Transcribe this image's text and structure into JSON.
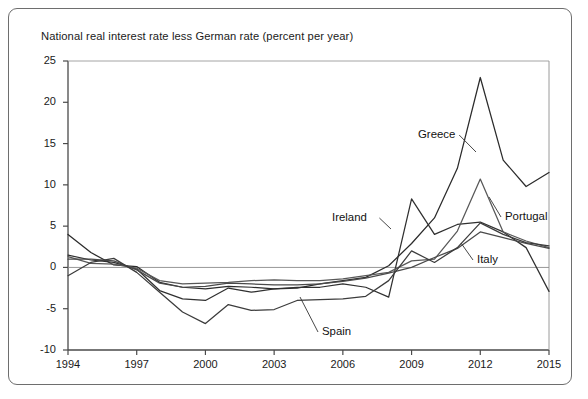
{
  "figure": {
    "title": "National real interest rate less German rate (percent per year)",
    "border_color": "#6e6e6e",
    "background": "#ffffff"
  },
  "axes": {
    "y_ticks": [
      "25",
      "20",
      "15",
      "10",
      "5",
      "0",
      "-5",
      "-10"
    ],
    "x_ticks": [
      "1994",
      "1997",
      "2000",
      "2003",
      "2006",
      "2009",
      "2012",
      "2015"
    ]
  },
  "series_labels": {
    "greece": "Greece",
    "ireland": "Ireland",
    "portugal": "Portugal",
    "italy": "Italy",
    "spain": "Spain"
  },
  "chart_data": {
    "type": "line",
    "title": "National real interest rate less German rate (percent per year)",
    "xlabel": "",
    "ylabel": "National real interest rate less German rate (percent per year)",
    "xlim": [
      1994,
      2015
    ],
    "ylim": [
      -10,
      25
    ],
    "y_ticks": [
      25,
      20,
      15,
      10,
      5,
      0,
      -5,
      -10
    ],
    "x_ticks": [
      1994,
      1997,
      2000,
      2003,
      2006,
      2009,
      2012,
      2015
    ],
    "grid": false,
    "legend": "inline-annotations",
    "zero_line": true,
    "x": [
      1994,
      1995,
      1996,
      1997,
      1998,
      1999,
      2000,
      2001,
      2002,
      2003,
      2004,
      2005,
      2006,
      2007,
      2008,
      2009,
      2010,
      2011,
      2012,
      2013,
      2014,
      2015
    ],
    "series": [
      {
        "name": "Greece",
        "color": "#2b2b2b",
        "values": [
          4.0,
          1.8,
          0.3,
          0.1,
          -1.8,
          -2.4,
          -2.6,
          -2.3,
          -2.4,
          -2.6,
          -2.5,
          -2.0,
          -1.6,
          -1.2,
          0.2,
          2.9,
          6.0,
          12.0,
          23.0,
          13.0,
          9.8,
          11.5
        ]
      },
      {
        "name": "Ireland",
        "color": "#303030",
        "values": [
          1.5,
          0.9,
          0.6,
          -0.2,
          -2.8,
          -3.8,
          -4.0,
          -2.5,
          -3.0,
          -2.6,
          -2.4,
          -2.4,
          -2.0,
          -2.4,
          -3.6,
          8.3,
          4.0,
          5.2,
          5.5,
          4.3,
          2.4,
          -2.9
        ]
      },
      {
        "name": "Portugal",
        "color": "#585858",
        "values": [
          1.3,
          0.5,
          0.4,
          -0.1,
          -1.6,
          -2.0,
          -1.9,
          -1.8,
          -1.6,
          -1.5,
          -1.6,
          -1.6,
          -1.4,
          -1.0,
          -0.6,
          0.8,
          1.0,
          4.4,
          10.7,
          4.3,
          3.2,
          2.4
        ]
      },
      {
        "name": "Italy",
        "color": "#4a4a4a",
        "values": [
          1.0,
          1.0,
          0.8,
          -0.3,
          -1.9,
          -2.4,
          -2.3,
          -1.9,
          -2.0,
          -2.1,
          -2.1,
          -2.0,
          -1.7,
          -1.3,
          -0.7,
          0.0,
          1.2,
          2.3,
          4.3,
          3.6,
          2.9,
          2.3
        ]
      },
      {
        "name": "Spain",
        "color": "#3c3c3c",
        "values": [
          -1.0,
          0.6,
          1.1,
          -0.6,
          -3.0,
          -5.4,
          -6.8,
          -4.5,
          -5.2,
          -5.1,
          -4.0,
          -3.9,
          -3.8,
          -3.5,
          -1.6,
          2.0,
          0.6,
          2.4,
          5.4,
          4.0,
          3.0,
          2.6
        ]
      }
    ],
    "annotations": [
      {
        "text": "Greece",
        "x_px": 418,
        "y_px": 128,
        "leader_to_px": [
          476,
          152
        ]
      },
      {
        "text": "Ireland",
        "x_px": 332,
        "y_px": 211,
        "leader_to_px": [
          391,
          229
        ]
      },
      {
        "text": "Portugal",
        "x_px": 505,
        "y_px": 210,
        "leader_to_px": [
          489,
          197
        ]
      },
      {
        "text": "Italy",
        "x_px": 477,
        "y_px": 253,
        "leader_to_px": [
          461,
          243
        ]
      },
      {
        "text": "Spain",
        "x_px": 322,
        "y_px": 325,
        "leader_to_px": [
          300,
          297
        ]
      }
    ]
  },
  "layout": {
    "plot_left_px": 68,
    "plot_right_px": 549,
    "plot_top_px": 61,
    "plot_bottom_px": 350
  }
}
